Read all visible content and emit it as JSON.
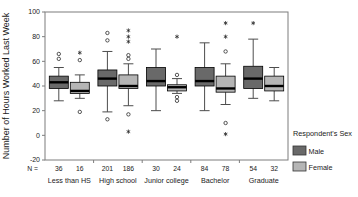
{
  "chart_data": {
    "type": "boxplot",
    "title": "",
    "ylabel": "Number of Hours Worked Last Week",
    "ylim": [
      -20,
      100
    ],
    "yticks": [
      -20,
      0,
      20,
      40,
      60,
      80,
      100
    ],
    "grid": false,
    "legend_position": "right",
    "n_prefix": "N =",
    "categories": [
      "Less than HS",
      "High school",
      "Junior college",
      "Bachelor",
      "Graduate"
    ],
    "legend_title": "Respondent's Sex",
    "series": [
      {
        "name": "Male",
        "color": "#696969",
        "n": [
          36,
          201,
          30,
          84,
          54
        ],
        "boxes": [
          {
            "whisker_low": 28,
            "q1": 38,
            "median": 43,
            "q3": 48,
            "whisker_high": 55,
            "outliers": [
              62,
              66
            ],
            "extremes": []
          },
          {
            "whisker_low": 19,
            "q1": 40,
            "median": 46,
            "q3": 53,
            "whisker_high": 68,
            "outliers": [
              13,
              77,
              83
            ],
            "extremes": []
          },
          {
            "whisker_low": 20,
            "q1": 40,
            "median": 44,
            "q3": 55,
            "whisker_high": 70,
            "outliers": [],
            "extremes": []
          },
          {
            "whisker_low": 20,
            "q1": 40,
            "median": 44,
            "q3": 55,
            "whisker_high": 75,
            "outliers": [],
            "extremes": []
          },
          {
            "whisker_low": 30,
            "q1": 38,
            "median": 46,
            "q3": 56,
            "whisker_high": 78,
            "outliers": [],
            "extremes": [
              91
            ]
          }
        ]
      },
      {
        "name": "Female",
        "color": "#b5b5b5",
        "n": [
          16,
          186,
          24,
          78,
          32
        ],
        "boxes": [
          {
            "whisker_low": 30,
            "q1": 34,
            "median": 36,
            "q3": 43,
            "whisker_high": 49,
            "outliers": [
              19,
              61
            ],
            "extremes": [
              67
            ]
          },
          {
            "whisker_low": 24,
            "q1": 38,
            "median": 40,
            "q3": 49,
            "whisker_high": 58,
            "outliers": [
              17,
              62,
              65
            ],
            "extremes": [
              3,
              76,
              80,
              85
            ]
          },
          {
            "whisker_low": 34,
            "q1": 36,
            "median": 39,
            "q3": 41,
            "whisker_high": 46,
            "outliers": [
              28,
              31,
              49
            ],
            "extremes": [
              80
            ]
          },
          {
            "whisker_low": 25,
            "q1": 35,
            "median": 38,
            "q3": 48,
            "whisker_high": 58,
            "outliers": [
              10,
              68
            ],
            "extremes": [
              1,
              80,
              91
            ]
          },
          {
            "whisker_low": 28,
            "q1": 36,
            "median": 40,
            "q3": 48,
            "whisker_high": 55,
            "outliers": [],
            "extremes": []
          }
        ]
      }
    ],
    "colors": {
      "male": "#696969",
      "female": "#b5b5b5",
      "median": "#000000",
      "box_border": "#000000",
      "whisker": "#4d4d4d",
      "frame": "#7d7d7d",
      "outlier": "#2b2b2b",
      "text": "#1a1a1a",
      "background": "#ffffff"
    }
  }
}
